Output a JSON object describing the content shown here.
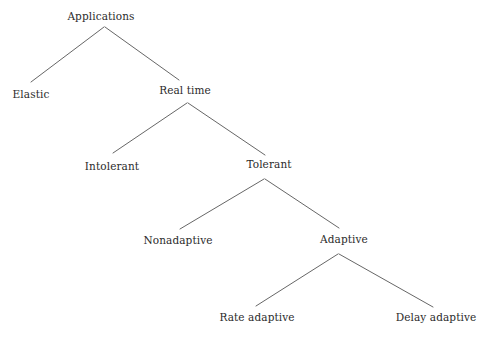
{
  "diagram": {
    "type": "tree",
    "background_color": "#ffffff",
    "line_color": "#555555",
    "text_color": "#2b2b2b",
    "nodes": [
      {
        "id": "applications",
        "label": "Applications",
        "cx": 101,
        "cy": 16,
        "level": 0
      },
      {
        "id": "elastic",
        "label": "Elastic",
        "cx": 31,
        "cy": 94,
        "level": 1
      },
      {
        "id": "real-time",
        "label": "Real time",
        "cx": 185,
        "cy": 90,
        "level": 1
      },
      {
        "id": "intolerant",
        "label": "Intolerant",
        "cx": 112,
        "cy": 166,
        "level": 2
      },
      {
        "id": "tolerant",
        "label": "Tolerant",
        "cx": 269,
        "cy": 164,
        "level": 2
      },
      {
        "id": "nonadaptive",
        "label": "Nonadaptive",
        "cx": 178,
        "cy": 240,
        "level": 3
      },
      {
        "id": "adaptive",
        "label": "Adaptive",
        "cx": 344,
        "cy": 239,
        "level": 3
      },
      {
        "id": "rate-adaptive",
        "label": "Rate adaptive",
        "cx": 257,
        "cy": 317,
        "level": 4
      },
      {
        "id": "delay-adaptive",
        "label": "Delay adaptive",
        "cx": 436,
        "cy": 317,
        "level": 4
      }
    ],
    "edges": [
      {
        "from": "applications",
        "to": "elastic",
        "x1": 104,
        "y1": 27,
        "x2": 31,
        "y2": 82
      },
      {
        "from": "applications",
        "to": "real-time",
        "x1": 105,
        "y1": 27,
        "x2": 179,
        "y2": 80
      },
      {
        "from": "real-time",
        "to": "intolerant",
        "x1": 187,
        "y1": 103,
        "x2": 113,
        "y2": 153
      },
      {
        "from": "real-time",
        "to": "tolerant",
        "x1": 188,
        "y1": 103,
        "x2": 265,
        "y2": 155
      },
      {
        "from": "tolerant",
        "to": "nonadaptive",
        "x1": 264,
        "y1": 179,
        "x2": 180,
        "y2": 229
      },
      {
        "from": "tolerant",
        "to": "adaptive",
        "x1": 265,
        "y1": 179,
        "x2": 339,
        "y2": 228
      },
      {
        "from": "adaptive",
        "to": "rate-adaptive",
        "x1": 338,
        "y1": 254,
        "x2": 256,
        "y2": 306
      },
      {
        "from": "adaptive",
        "to": "delay-adaptive",
        "x1": 339,
        "y1": 254,
        "x2": 433,
        "y2": 307
      }
    ]
  }
}
